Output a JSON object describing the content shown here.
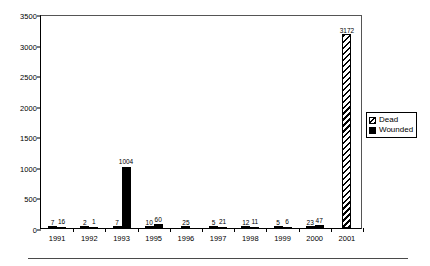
{
  "chart_data": {
    "type": "bar",
    "title": "",
    "subtitle": "",
    "xlabel": "",
    "ylabel": "",
    "ylim": [
      0,
      3500
    ],
    "ytick_step": 500,
    "yticks": [
      "0",
      "500",
      "1000",
      "1500",
      "2000",
      "2500",
      "3000",
      "3500"
    ],
    "grid": false,
    "legend_position": "right",
    "categories": [
      "1991",
      "1992",
      "1993",
      "1995",
      "1996",
      "1997",
      "1998",
      "1999",
      "2000",
      "2001"
    ],
    "series": [
      {
        "name": "Dead",
        "pattern": "diagonal-hatch",
        "color": "#000000",
        "values": [
          7,
          2,
          7,
          10,
          25,
          5,
          12,
          5,
          23,
          3172
        ]
      },
      {
        "name": "Wounded",
        "pattern": "solid",
        "color": "#000000",
        "values": [
          16,
          1,
          1004,
          60,
          null,
          21,
          11,
          6,
          47,
          null
        ]
      }
    ],
    "data_labels": [
      {
        "category": "1991",
        "dead": "7",
        "wounded": "16"
      },
      {
        "category": "1992",
        "dead": "2",
        "wounded": "1"
      },
      {
        "category": "1993",
        "dead": "7",
        "wounded": "1004"
      },
      {
        "category": "1995",
        "dead": "10",
        "wounded": "60"
      },
      {
        "category": "1996",
        "dead": "25",
        "wounded": ""
      },
      {
        "category": "1997",
        "dead": "5",
        "wounded": "21"
      },
      {
        "category": "1998",
        "dead": "12",
        "wounded": "11"
      },
      {
        "category": "1999",
        "dead": "5",
        "wounded": "6"
      },
      {
        "category": "2000",
        "dead": "23",
        "wounded": "47"
      },
      {
        "category": "2001",
        "dead": "3172",
        "wounded": ""
      }
    ]
  },
  "legend": {
    "items": [
      {
        "label": "Dead",
        "swatch": "diagonal-hatch-swatch"
      },
      {
        "label": "Wounded",
        "swatch": "solid-black-swatch"
      }
    ]
  }
}
